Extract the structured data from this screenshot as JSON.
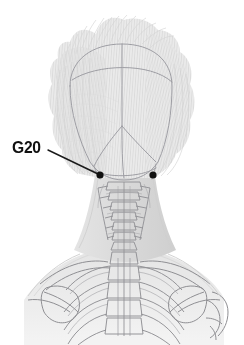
{
  "figure": {
    "view": "posterior",
    "background_color": "#ffffff",
    "width": 244,
    "height": 345
  },
  "annotations": {
    "labels": [
      {
        "id": "g20",
        "text": "G20",
        "name": "Gall Bladder 20",
        "color": "#111111",
        "x": 12,
        "y": 139
      }
    ],
    "leader_lines": [
      {
        "id": "g20-leader",
        "x1": 48,
        "y1": 150,
        "x2": 98,
        "y2": 174,
        "color": "#1a1a1a",
        "width": 1.4
      }
    ],
    "points": [
      {
        "id": "g20-left",
        "label": "G20",
        "x": 100,
        "y": 175,
        "r": 3.6,
        "color": "#111111"
      },
      {
        "id": "g20-right",
        "label": "G20",
        "x": 153,
        "y": 175,
        "r": 3.6,
        "color": "#111111"
      }
    ]
  },
  "palette": {
    "background": "#ffffff",
    "hair_light": "#efefef",
    "hair_mid": "#dedede",
    "hair_dark": "#c9c9c9",
    "skin_shade": "#e3e3e3",
    "bone_outline": "#8f8f93",
    "skull_suture": "#9a9aa0",
    "marker": "#111111"
  },
  "structures": [
    {
      "name": "hair",
      "type": "fine-stroke-texture"
    },
    {
      "name": "skull-outline",
      "type": "curve"
    },
    {
      "name": "sagittal-suture",
      "type": "curve"
    },
    {
      "name": "coronal-suture",
      "type": "curve"
    },
    {
      "name": "lambdoid-suture",
      "type": "curve"
    },
    {
      "name": "occiput",
      "type": "curve"
    },
    {
      "name": "cervical-vertebrae",
      "type": "bone-outline",
      "count": 7
    },
    {
      "name": "thoracic-vertebrae",
      "type": "bone-outline",
      "count": 5
    },
    {
      "name": "ribs",
      "type": "bone-outline"
    },
    {
      "name": "clavicles",
      "type": "bone-outline"
    },
    {
      "name": "scapulae",
      "type": "bone-outline"
    },
    {
      "name": "humerus-right",
      "type": "bone-outline"
    },
    {
      "name": "neck-musculature",
      "type": "shade"
    },
    {
      "name": "shoulders",
      "type": "shade"
    }
  ]
}
